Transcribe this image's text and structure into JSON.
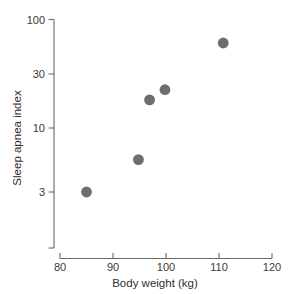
{
  "chart_data": {
    "type": "scatter",
    "title": "",
    "subtitle": "",
    "xlabel": "Body weight (kg)",
    "ylabel": "Sleep apnea index",
    "xlim": [
      80,
      120
    ],
    "ylim": [
      2,
      100
    ],
    "xscale": "linear",
    "yscale": "log",
    "grid": false,
    "legend": false,
    "legend_position": "none",
    "xticks": [
      80,
      90,
      100,
      110,
      120
    ],
    "xticklabels": [
      "80",
      "90",
      "100",
      "110",
      "120"
    ],
    "yticks": [
      3,
      10,
      30,
      100
    ],
    "yticklabels": [
      "3",
      "10",
      "30",
      "100"
    ],
    "marker": "filled-circle",
    "marker_color": "#6e6e6e",
    "marker_size": 5.4,
    "x": [
      85,
      94.8,
      96.9,
      99.8,
      110.8
    ],
    "y": [
      3,
      5.8,
      19.5,
      24,
      62
    ],
    "points": [
      {
        "x": 85,
        "y": 3
      },
      {
        "x": 94.8,
        "y": 5.8
      },
      {
        "x": 96.9,
        "y": 19.5
      },
      {
        "x": 99.8,
        "y": 24
      },
      {
        "x": 110.8,
        "y": 62
      }
    ]
  },
  "axes": {
    "x_title": "Body weight (kg)",
    "y_title": "Sleep apnea index",
    "x_tick_labels": [
      "80",
      "90",
      "100",
      "110",
      "120"
    ],
    "y_tick_labels": [
      "100",
      "30",
      "10",
      "3"
    ]
  },
  "colors": {
    "marker": "#6e6e6e",
    "axis": "#6a6a6a",
    "text": "#333333",
    "background": "#ffffff"
  }
}
